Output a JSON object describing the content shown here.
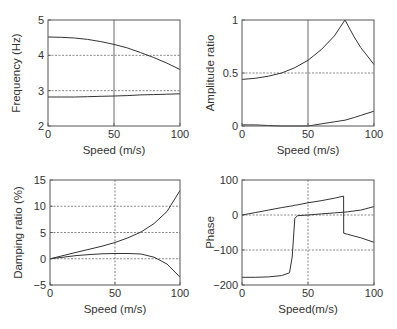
{
  "chart_data": [
    {
      "type": "line",
      "title": "",
      "xlabel": "Speed (m/s)",
      "ylabel": "Frequency (Hz)",
      "xlim": [
        0,
        100
      ],
      "ylim": [
        2,
        5
      ],
      "xticks": [
        "0",
        "50",
        "100"
      ],
      "yticks": [
        "2",
        "3",
        "4",
        "5"
      ],
      "grid": "dotted horizontal at 3 and 4; solid vertical at 50",
      "x": [
        0,
        10,
        20,
        30,
        40,
        50,
        60,
        70,
        80,
        90,
        100
      ],
      "series": [
        {
          "name": "mode 1",
          "values": [
            4.52,
            4.51,
            4.49,
            4.45,
            4.39,
            4.31,
            4.21,
            4.08,
            3.94,
            3.78,
            3.6
          ]
        },
        {
          "name": "mode 2",
          "values": [
            2.82,
            2.82,
            2.82,
            2.83,
            2.84,
            2.85,
            2.86,
            2.88,
            2.89,
            2.9,
            2.91
          ]
        }
      ]
    },
    {
      "type": "line",
      "title": "",
      "xlabel": "Speed (m/s)",
      "ylabel": "Amplitude ratio",
      "xlim": [
        0,
        100
      ],
      "ylim": [
        0,
        1
      ],
      "xticks": [
        "0",
        "50",
        "100"
      ],
      "yticks": [
        "0",
        "0.5",
        "1"
      ],
      "grid": "dotted horizontal at 0.5; solid vertical at 50",
      "x": [
        0,
        10,
        20,
        30,
        40,
        50,
        60,
        70,
        78,
        85,
        90,
        100
      ],
      "series": [
        {
          "name": "mode 1",
          "values": [
            0.44,
            0.45,
            0.47,
            0.5,
            0.55,
            0.62,
            0.72,
            0.85,
            1.0,
            0.84,
            0.74,
            0.58
          ]
        },
        {
          "name": "mode 2",
          "values": [
            0.01,
            0.01,
            0.005,
            0.0,
            0.0,
            0.0,
            0.02,
            0.04,
            0.055,
            0.08,
            0.1,
            0.14
          ]
        }
      ]
    },
    {
      "type": "line",
      "title": "",
      "xlabel": "Speed (m/s)",
      "ylabel": "Damping ratio (%)",
      "xlim": [
        0,
        100
      ],
      "ylim": [
        -5,
        15
      ],
      "xticks": [
        "0",
        "50",
        "100"
      ],
      "yticks": [
        "-5",
        "0",
        "5",
        "10",
        "15"
      ],
      "grid": "dotted horizontal at 0, 5, 10; dotted vertical at 50",
      "x": [
        0,
        10,
        20,
        30,
        40,
        50,
        60,
        70,
        80,
        90,
        100
      ],
      "series": [
        {
          "name": "mode 1",
          "values": [
            0,
            0.6,
            1.2,
            1.8,
            2.4,
            3.1,
            4.0,
            5.1,
            6.7,
            9.0,
            13.0
          ]
        },
        {
          "name": "mode 2",
          "values": [
            0,
            0.3,
            0.6,
            0.8,
            0.95,
            1.0,
            1.0,
            0.9,
            0.3,
            -1.0,
            -3.5
          ]
        }
      ]
    },
    {
      "type": "line",
      "title": "",
      "xlabel": "Speed(m/s)",
      "ylabel": "Phase",
      "xlim": [
        0,
        100
      ],
      "ylim": [
        -200,
        100
      ],
      "xticks": [
        "0",
        "50",
        "100"
      ],
      "yticks": [
        "-200",
        "-100",
        "0",
        "100"
      ],
      "grid": "dotted horizontal at -100, 0; dotted vertical at 50",
      "x": [
        0,
        10,
        20,
        30,
        36,
        38,
        40,
        42,
        50,
        60,
        70,
        77,
        77.01,
        80,
        90,
        100
      ],
      "series": [
        {
          "name": "mode 1",
          "values": [
            0,
            7,
            14,
            21,
            25,
            26,
            28,
            29,
            35,
            41,
            48,
            54,
            -52,
            -55,
            -65,
            -78
          ]
        },
        {
          "name": "mode 2",
          "values": [
            -178,
            -178,
            -177,
            -173,
            -165,
            -120,
            -10,
            -2,
            0,
            3,
            6,
            8,
            8,
            9,
            14,
            24
          ]
        }
      ]
    }
  ]
}
